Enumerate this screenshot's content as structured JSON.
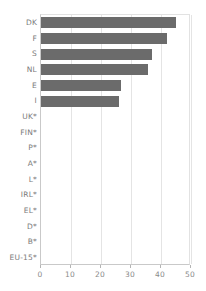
{
  "chart_data": {
    "type": "bar",
    "orientation": "horizontal",
    "title": "",
    "subtitle": "",
    "xlabel": "",
    "ylabel": "",
    "xlim": [
      0,
      50
    ],
    "ylim": null,
    "grid": true,
    "legend": null,
    "legend_position": "none",
    "xticks": [
      0,
      10,
      20,
      30,
      40,
      50
    ],
    "xtick_labels": [
      "0",
      "10",
      "20",
      "30",
      "40",
      "50"
    ],
    "categories": [
      "DK",
      "F",
      "S",
      "NL",
      "E",
      "I",
      "UK*",
      "FIN*",
      "P*",
      "A*",
      "L*",
      "IRL*",
      "EL*",
      "D*",
      "B*",
      "EU-15*"
    ],
    "values": [
      45,
      42,
      37,
      35.5,
      26.5,
      26,
      0,
      0,
      0,
      0,
      0,
      0,
      0,
      0,
      0,
      0
    ],
    "annotations": [
      "* no data available"
    ],
    "colors": {
      "bar": "#6b6b6b",
      "grid": "#e4e4e4",
      "axis": "#c9c9c9",
      "tick_label": "#8a8a8a",
      "category_label": "#7a7a7a",
      "background": "#ffffff"
    }
  }
}
